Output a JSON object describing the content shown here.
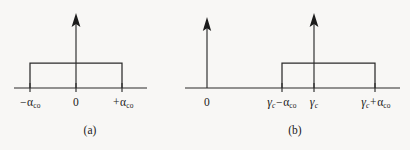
{
  "figure": {
    "background_color": "#f8f7f5",
    "line_color": "#2b2b2b",
    "panels": [
      {
        "id": "a",
        "caption": "(a)",
        "axis_origin_label": "0",
        "ticks": [
          {
            "label_parts": {
              "prefix": "− ",
              "symbol": "α",
              "subscript": "co"
            },
            "text": "− αco"
          },
          {
            "label_parts": {
              "prefix": "",
              "symbol": "0",
              "subscript": ""
            },
            "text": "0"
          },
          {
            "label_parts": {
              "prefix": "+ ",
              "symbol": "α",
              "subscript": "co"
            },
            "text": "+ αco"
          }
        ],
        "rect_left_label": "− αco",
        "rect_right_label": "+ αco",
        "vertical_arrow_label": "0"
      },
      {
        "id": "b",
        "caption": "(b)",
        "axis_origin_label": "0",
        "ticks": [
          {
            "text": "γc − αco"
          },
          {
            "text": "γc"
          },
          {
            "text": "γc + αco"
          }
        ],
        "rect_left_label": "γc − αco",
        "rect_center_label": "γc",
        "rect_right_label": "γc + αco"
      }
    ],
    "symbols": {
      "alpha": "α",
      "gamma": "γ",
      "minus": "−",
      "plus": "+",
      "subscript_co": "co",
      "subscript_c": "c",
      "zero": "0"
    }
  }
}
